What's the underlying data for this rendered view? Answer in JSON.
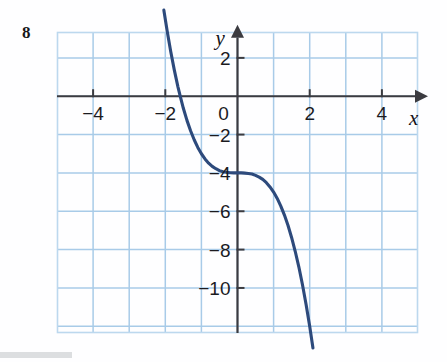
{
  "figure": {
    "problem_number": "8",
    "background_color": "#fefeff"
  },
  "colors": {
    "grid": "#a8cbe8",
    "grid_outer": "#bcd8ee",
    "axis": "#3b3b40",
    "curve": "#2d4a7c",
    "label": "#1b1b1f"
  },
  "axes": {
    "x_name": "x",
    "y_name": "y",
    "x_ticks": [
      {
        "value": -4,
        "label": "−4"
      },
      {
        "value": -2,
        "label": "−2"
      },
      {
        "value": 2,
        "label": "2"
      },
      {
        "value": 4,
        "label": "4"
      }
    ],
    "y_ticks": [
      {
        "value": 2,
        "label": "2"
      },
      {
        "value": -2,
        "label": "−2"
      },
      {
        "value": -4,
        "label": "−4"
      },
      {
        "value": -6,
        "label": "−6"
      },
      {
        "value": -8,
        "label": "−8"
      },
      {
        "value": -10,
        "label": "−10"
      }
    ],
    "origin_label": "0"
  },
  "chart_data": {
    "type": "line",
    "title": "",
    "subtitle": "",
    "xlabel": "x",
    "ylabel": "y",
    "xlim": [
      -5,
      5
    ],
    "ylim": [
      -12.35,
      3.35
    ],
    "grid": true,
    "grid_step_x": 1,
    "grid_step_y": 2,
    "legend": null,
    "annotations": [
      {
        "text": "inflection point",
        "x": 0,
        "y": -4
      }
    ],
    "series": [
      {
        "name": "y = -x^3 - 4",
        "equation": "y = −x³ − 4",
        "color": "#2d4a7c",
        "x": [
          -2.04,
          -1.95,
          -1.85,
          -1.75,
          -1.65,
          -1.587,
          -1.5,
          -1.4,
          -1.3,
          -1.2,
          -1.1,
          -1.0,
          -0.9,
          -0.8,
          -0.7,
          -0.6,
          -0.5,
          -0.4,
          -0.3,
          -0.2,
          -0.1,
          0.0,
          0.1,
          0.2,
          0.3,
          0.4,
          0.5,
          0.6,
          0.7,
          0.8,
          0.9,
          1.0,
          1.1,
          1.2,
          1.3,
          1.4,
          1.5,
          1.6,
          1.7,
          1.8,
          1.9,
          2.0,
          2.09
        ],
        "y": [
          4.49,
          3.41,
          2.33,
          1.36,
          0.49,
          0.0,
          -0.63,
          -1.26,
          -1.8,
          -2.27,
          -2.67,
          -3.0,
          -3.27,
          -3.49,
          -3.66,
          -3.78,
          -3.88,
          -3.94,
          -3.97,
          -3.99,
          -4.0,
          -4.0,
          -4.0,
          -4.01,
          -4.03,
          -4.06,
          -4.13,
          -4.22,
          -4.34,
          -4.51,
          -4.73,
          -5.0,
          -5.33,
          -5.73,
          -6.2,
          -6.74,
          -7.38,
          -8.1,
          -8.91,
          -9.83,
          -10.86,
          -12.0,
          -13.13
        ]
      }
    ],
    "x_tick_values": [
      -4,
      -2,
      2,
      4
    ],
    "y_tick_values": [
      2,
      -2,
      -4,
      -6,
      -8,
      -10
    ]
  }
}
